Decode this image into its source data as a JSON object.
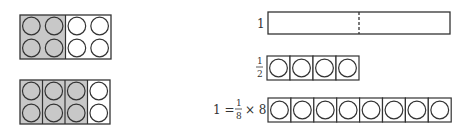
{
  "diagram": {
    "left_models": [
      {
        "name": "two-columns-shaded-of-four",
        "columns": 4,
        "rows": 2,
        "groups": 2,
        "shaded_groups": 1
      },
      {
        "name": "three-of-four-columns-shaded",
        "columns": 4,
        "rows": 2,
        "groups": 4,
        "shaded_groups": 3
      }
    ],
    "right_models": [
      {
        "label": "1",
        "kind": "whole-bar",
        "halves_marked": true
      },
      {
        "label_num": "1",
        "label_den": "2",
        "kind": "counter-bar",
        "cells": 4
      },
      {
        "label_prefix": "1 =",
        "label_num": "1",
        "label_den": "8",
        "label_suffix": "× 8",
        "kind": "counter-bar",
        "cells": 8
      }
    ],
    "colors": {
      "shade": "#c8c8c8",
      "stroke": "#333333"
    }
  }
}
